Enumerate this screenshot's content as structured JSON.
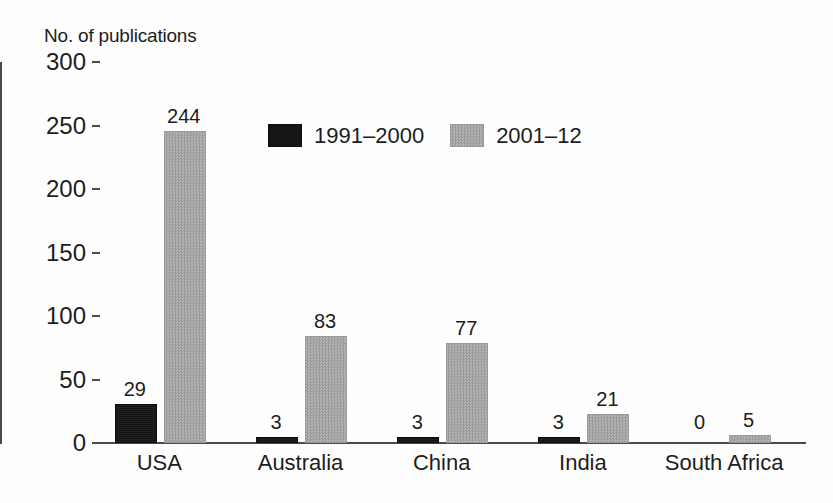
{
  "chart_data": {
    "type": "bar",
    "title": "",
    "subtitle": "",
    "ylabel": "No. of publications",
    "xlabel": "",
    "categories": [
      "USA",
      "Australia",
      "China",
      "India",
      "South Africa"
    ],
    "series": [
      {
        "name": "1991–2000",
        "color": "#151515",
        "values": [
          29,
          3,
          3,
          3,
          0
        ]
      },
      {
        "name": "2001–12",
        "color": "#a6a6a6",
        "values": [
          244,
          83,
          77,
          21,
          5
        ]
      }
    ],
    "value_labels": {
      "1991–2000": [
        "29",
        "3",
        "3",
        "3",
        "0"
      ],
      "2001–12": [
        "244",
        "83",
        "77",
        "21",
        "5"
      ]
    },
    "ylim": [
      0,
      300
    ],
    "yticks": [
      0,
      50,
      100,
      150,
      200,
      250,
      300
    ],
    "ytick_labels": [
      "0",
      "50",
      "100",
      "150",
      "200",
      "250",
      "300"
    ],
    "grid": false,
    "legend_position": "inside-top-center",
    "bar_labels_shown": true
  },
  "legend": {
    "entries": [
      {
        "label": "1991–2000",
        "swatch": "dark-swatch"
      },
      {
        "label": "2001–12",
        "swatch": "hatched-gray-swatch"
      }
    ]
  }
}
